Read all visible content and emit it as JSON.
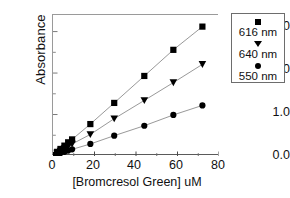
{
  "chart_data": {
    "type": "scatter",
    "title": "",
    "xlabel": "[Bromcresol Green] uM",
    "ylabel": "Absorbance",
    "xlim": [
      0,
      80
    ],
    "ylim": [
      0,
      3.4
    ],
    "xticks": [
      0,
      20,
      40,
      60,
      80
    ],
    "yticks": [
      "0.0",
      "1.0",
      "2.0",
      "3.0"
    ],
    "xtick_labels": [
      "0",
      "20",
      "40",
      "60",
      "80"
    ],
    "grid": false,
    "legend_position": "outside-right-top",
    "series": [
      {
        "name": "616 nm",
        "marker": "square",
        "color": "#000000",
        "points": [
          {
            "x": 0.0,
            "y": 0.02
          },
          {
            "x": 2.0,
            "y": 0.1
          },
          {
            "x": 3.6,
            "y": 0.17
          },
          {
            "x": 5.5,
            "y": 0.25
          },
          {
            "x": 7.3,
            "y": 0.33
          },
          {
            "x": 9.2,
            "y": 0.4
          },
          {
            "x": 18.0,
            "y": 0.77
          },
          {
            "x": 29.5,
            "y": 1.28
          },
          {
            "x": 44.0,
            "y": 1.93
          },
          {
            "x": 58.0,
            "y": 2.56
          },
          {
            "x": 72.0,
            "y": 3.12
          }
        ]
      },
      {
        "name": "640 nm",
        "marker": "triangle-down",
        "color": "#000000",
        "points": [
          {
            "x": 0.0,
            "y": 0.01
          },
          {
            "x": 2.0,
            "y": 0.07
          },
          {
            "x": 3.6,
            "y": 0.12
          },
          {
            "x": 5.5,
            "y": 0.18
          },
          {
            "x": 7.3,
            "y": 0.23
          },
          {
            "x": 9.2,
            "y": 0.29
          },
          {
            "x": 18.0,
            "y": 0.52
          },
          {
            "x": 29.5,
            "y": 0.9
          },
          {
            "x": 44.0,
            "y": 1.34
          },
          {
            "x": 58.0,
            "y": 1.77
          },
          {
            "x": 72.0,
            "y": 2.21
          }
        ]
      },
      {
        "name": "550 nm",
        "marker": "circle",
        "color": "#000000",
        "points": [
          {
            "x": 0.0,
            "y": 0.0
          },
          {
            "x": 2.0,
            "y": 0.04
          },
          {
            "x": 3.6,
            "y": 0.07
          },
          {
            "x": 5.5,
            "y": 0.1
          },
          {
            "x": 7.3,
            "y": 0.13
          },
          {
            "x": 9.2,
            "y": 0.16
          },
          {
            "x": 18.0,
            "y": 0.29
          },
          {
            "x": 29.5,
            "y": 0.49
          },
          {
            "x": 44.0,
            "y": 0.73
          },
          {
            "x": 58.0,
            "y": 0.99
          },
          {
            "x": 72.0,
            "y": 1.22
          }
        ]
      }
    ]
  },
  "legend": {
    "entries": [
      {
        "label": "616 nm",
        "marker": "square"
      },
      {
        "label": "640 nm",
        "marker": "triangle-down"
      },
      {
        "label": "550 nm",
        "marker": "circle"
      }
    ]
  }
}
